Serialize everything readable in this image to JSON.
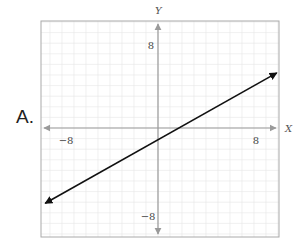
{
  "option": {
    "label": "A."
  },
  "chart_data": {
    "type": "line",
    "title": "",
    "xlabel": "X",
    "ylabel": "Y",
    "xlim": [
      -10,
      10
    ],
    "ylim": [
      -10,
      10
    ],
    "grid": true,
    "legend": "none",
    "tick_labels": {
      "x": [
        "−8",
        "8"
      ],
      "y": [
        "8",
        "−8"
      ]
    },
    "x_ticks": [
      -8,
      8
    ],
    "y_ticks": [
      8,
      -8
    ],
    "series": [
      {
        "name": "line",
        "equation": "y = (2/3)x − 1",
        "x": [
          -9.4,
          9.9
        ],
        "y": [
          -7.1,
          5.2
        ],
        "arrows_both_ends": true,
        "color": "#111111"
      }
    ],
    "colors": {
      "axis": "#9a9a9a",
      "grid": "#e6e6e6",
      "frame": "#aaaaaa",
      "line": "#111111"
    }
  }
}
